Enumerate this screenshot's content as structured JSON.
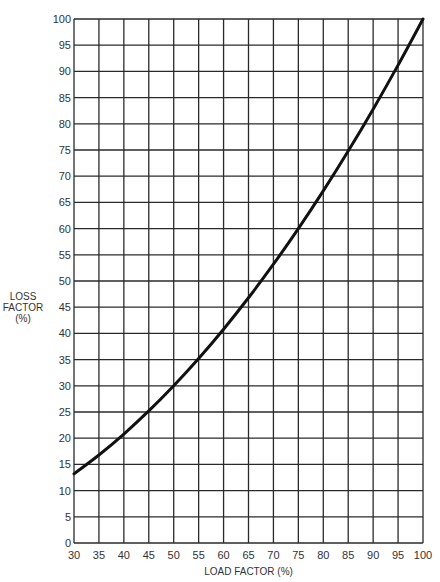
{
  "chart_data": {
    "type": "line",
    "title": "",
    "xlabel": "LOAD FACTOR (%)",
    "ylabel": "LOSS FACTOR (%)",
    "ylabel_lines": [
      "LOSS",
      "FACTOR",
      "(%)"
    ],
    "xlim": [
      30,
      100
    ],
    "ylim": [
      0,
      100
    ],
    "grid": true,
    "legend": "none",
    "x_ticks": [
      30,
      35,
      40,
      45,
      50,
      55,
      60,
      65,
      70,
      75,
      80,
      85,
      90,
      95,
      100
    ],
    "y_ticks": [
      0,
      5,
      10,
      15,
      20,
      25,
      30,
      35,
      40,
      45,
      50,
      55,
      60,
      65,
      70,
      75,
      80,
      85,
      90,
      95,
      100
    ],
    "series": [
      {
        "name": "Loss Factor",
        "x": [
          30,
          35,
          40,
          45,
          50,
          55,
          60,
          65,
          70,
          75,
          80,
          85,
          90,
          95,
          100
        ],
        "values": [
          13.2,
          16.8,
          20.8,
          25.2,
          30.0,
          35.2,
          40.8,
          46.8,
          53.2,
          60.0,
          67.2,
          74.8,
          82.8,
          91.2,
          100.0
        ]
      }
    ]
  },
  "colors": {
    "grid": "#2a2a2a",
    "curve": "#111111",
    "text": "#333333",
    "background": "#ffffff"
  }
}
